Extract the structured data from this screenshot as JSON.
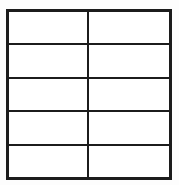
{
  "figure": {
    "type": "grid-table",
    "title": "",
    "caption": "",
    "rows": 5,
    "columns": 2,
    "background_color": "#fdfdfd",
    "border_color": "#1c1c1c",
    "cell_fill_color": "#ffffff",
    "shaded_fill_color": "#8a8a8a",
    "shaded_pattern": "checkerboard-dither-50-percent"
  },
  "table": {
    "column_labels": [
      "",
      ""
    ],
    "row_labels": [
      "",
      "",
      "",
      "",
      ""
    ],
    "cells": [
      [
        {
          "text": "",
          "state": "empty"
        },
        {
          "text": "",
          "state": "empty"
        }
      ],
      [
        {
          "text": "",
          "state": "empty"
        },
        {
          "text": "",
          "state": "empty"
        }
      ],
      [
        {
          "text": "",
          "state": "empty"
        },
        {
          "text": "",
          "state": "empty"
        }
      ],
      [
        {
          "text": "",
          "state": "empty"
        },
        {
          "text": "",
          "state": "empty"
        }
      ],
      [
        {
          "text": "",
          "state": "shaded"
        },
        {
          "text": "",
          "state": "empty"
        }
      ]
    ]
  }
}
